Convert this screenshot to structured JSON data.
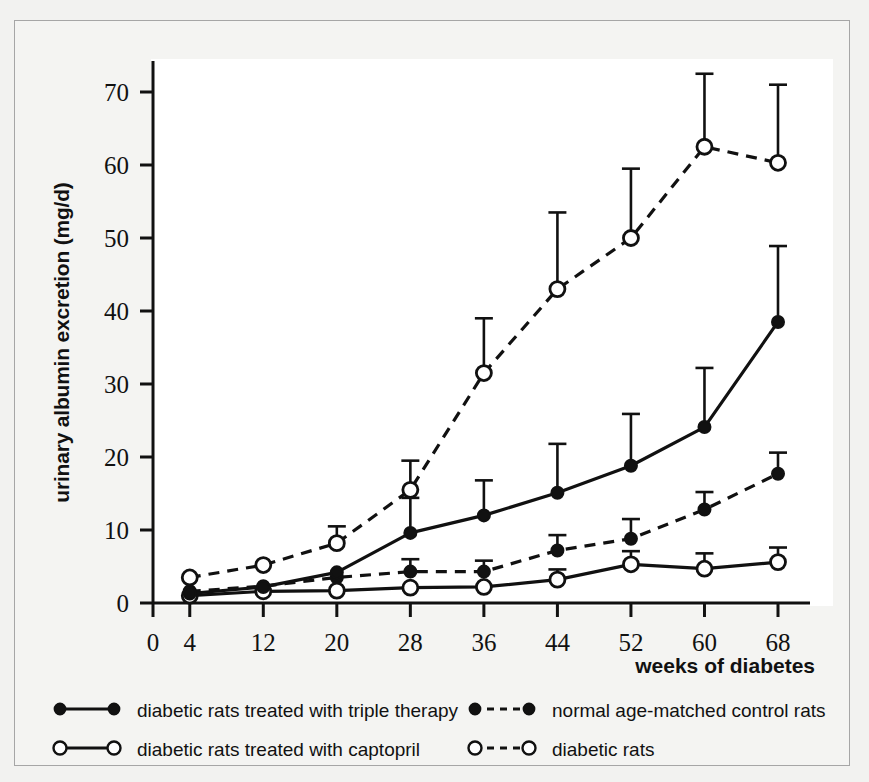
{
  "chart_data": {
    "type": "line",
    "title": "",
    "xlabel": "weeks of diabetes",
    "ylabel": "urinary albumin excretion (mg/d)",
    "x": [
      4,
      12,
      20,
      28,
      36,
      44,
      52,
      60,
      68
    ],
    "xticks": [
      0,
      4,
      12,
      20,
      28,
      36,
      44,
      52,
      60,
      68
    ],
    "xtick_labels": [
      "0",
      "4",
      "12",
      "20",
      "28",
      "36",
      "44",
      "52",
      "60",
      "68"
    ],
    "yticks": [
      0,
      10,
      20,
      30,
      40,
      50,
      60,
      70
    ],
    "ytick_labels": [
      "0",
      "10",
      "20",
      "30",
      "40",
      "50",
      "60",
      "70"
    ],
    "xlim": [
      0,
      72
    ],
    "ylim": [
      0,
      74
    ],
    "grid": false,
    "legend_position": "below-axes",
    "error_bars": "upper only (SEM)",
    "series": [
      {
        "name": "diabetic rats",
        "key": "diabetic",
        "marker": "open-circle",
        "line": "dashed",
        "values": [
          3.5,
          5.2,
          8.2,
          15.5,
          31.5,
          43.0,
          50.0,
          62.5,
          60.3
        ],
        "err_upper": [
          3.5,
          5.2,
          10.5,
          19.5,
          39.0,
          53.5,
          59.5,
          72.5,
          71.0
        ]
      },
      {
        "name": "diabetic rats treated with triple therapy",
        "key": "triple_therapy",
        "marker": "filled-circle",
        "line": "solid",
        "values": [
          1.3,
          2.2,
          4.2,
          9.6,
          12.0,
          15.1,
          18.8,
          24.1,
          38.5
        ],
        "err_upper": [
          1.3,
          2.2,
          4.2,
          14.4,
          16.8,
          21.8,
          25.9,
          32.2,
          48.9
        ]
      },
      {
        "name": "normal age-matched control rats",
        "key": "control",
        "marker": "filled-circle",
        "line": "dashed",
        "values": [
          1.6,
          2.3,
          3.5,
          4.3,
          4.3,
          7.2,
          8.8,
          12.8,
          17.7
        ],
        "err_upper": [
          1.6,
          2.3,
          3.5,
          6.0,
          5.8,
          9.3,
          11.5,
          15.2,
          20.6
        ]
      },
      {
        "name": "diabetic rats treated with captopril",
        "key": "captopril",
        "marker": "open-circle",
        "line": "solid",
        "values": [
          1.0,
          1.6,
          1.7,
          2.1,
          2.2,
          3.2,
          5.3,
          4.7,
          5.6
        ],
        "err_upper": [
          1.0,
          1.6,
          1.7,
          2.1,
          2.2,
          4.6,
          7.1,
          6.8,
          7.6
        ]
      }
    ]
  },
  "axes": {
    "ylabel": "urinary albumin excretion (mg/d)",
    "xlabel": "weeks of diabetes"
  },
  "legend": {
    "entries": [
      {
        "label": "diabetic rats treated with triple therapy",
        "marker": "filled-circle",
        "line": "solid"
      },
      {
        "label": "normal age-matched control rats",
        "marker": "filled-circle",
        "line": "dashed"
      },
      {
        "label": "diabetic rats treated with captopril",
        "marker": "open-circle",
        "line": "solid"
      },
      {
        "label": "diabetic rats",
        "marker": "open-circle",
        "line": "dashed"
      }
    ]
  },
  "colors": {
    "ink": "#111111",
    "page_background": "#f2f2f0",
    "figure_background": "#f4f4f2",
    "plot_background": "#ffffff",
    "frame_border": "#a6a6a6"
  }
}
